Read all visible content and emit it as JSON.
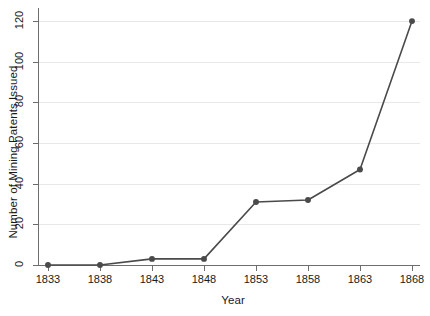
{
  "chart_data": {
    "type": "line",
    "title": "",
    "xlabel": "Year",
    "ylabel": "Number of Mining Patents Issued",
    "x": [
      1833,
      1838,
      1843,
      1848,
      1853,
      1858,
      1863,
      1868
    ],
    "xtick_labels": [
      "1833",
      "1838",
      "1843",
      "1848",
      "1853",
      "1858",
      "1863",
      "1868"
    ],
    "values": [
      0,
      0,
      3,
      3,
      31,
      32,
      47,
      120
    ],
    "ytick_labels": [
      "0",
      "20",
      "40",
      "60",
      "80",
      "100",
      "120"
    ],
    "yticks": [
      0,
      20,
      40,
      60,
      80,
      100,
      120
    ],
    "ylim": [
      0,
      124
    ],
    "xlim": [
      1831,
      1870
    ],
    "grid": true,
    "legend": false,
    "series_color": "#4a4a4a",
    "grid_color": "#e8e8e8",
    "axis_color": "#6d6d6d",
    "marker": "circle",
    "marker_size": 4,
    "line_width": 1.6
  }
}
